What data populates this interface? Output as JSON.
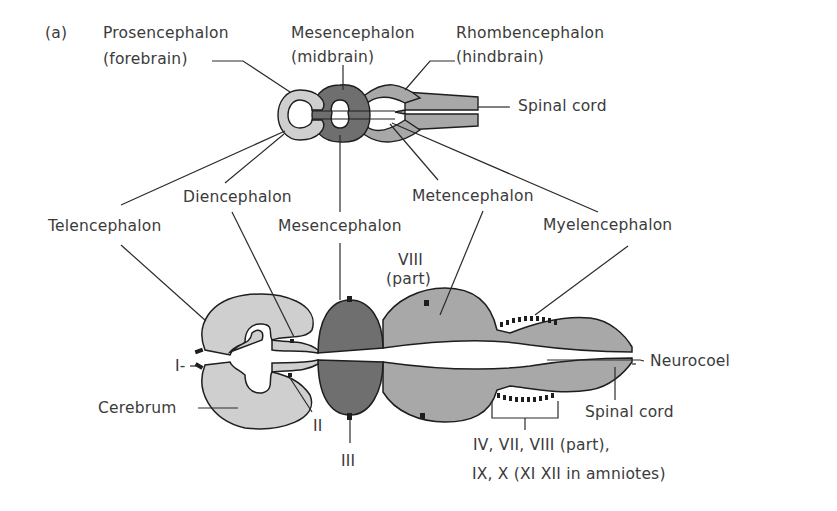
{
  "figure": {
    "panel_label": "(a)",
    "top_view": {
      "prosencephalon": {
        "line1": "Prosencephalon",
        "line2": "(forebrain)"
      },
      "mesencephalon": {
        "line1": "Mesencephalon",
        "line2": "(midbrain)"
      },
      "rhombencephalon": {
        "line1": "Rhombencephalon",
        "line2": "(hindbrain)"
      },
      "spinal_cord": "Spinal cord"
    },
    "subdivisions": {
      "telencephalon": "Telencephalon",
      "diencephalon": "Diencephalon",
      "mesencephalon": "Mesencephalon",
      "metencephalon": "Metencephalon",
      "myelencephalon": "Myelencephalon"
    },
    "bottom_view": {
      "nerve_viii": {
        "line1": "VIII",
        "line2": "(part)"
      },
      "nerve_i": "I-",
      "cerebrum": "Cerebrum",
      "nerve_ii": "II",
      "nerve_iii": "III",
      "neurocoel": "Neurocoel",
      "spinal_cord": "Spinal cord",
      "cranial_nerves": {
        "line1": "IV, VII, VIII (part),",
        "line2": "IX, X (XI XII in amniotes)"
      }
    },
    "colors": {
      "forebrain_fill": "#cfcfcf",
      "midbrain_fill": "#6f6f6f",
      "hindbrain_fill": "#a8a8a8",
      "outline": "#1e1e1e",
      "text": "#3b3b3b"
    }
  }
}
